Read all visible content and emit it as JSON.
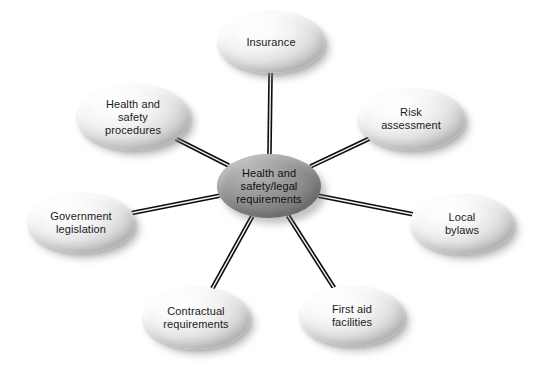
{
  "diagram": {
    "type": "radial-spoke-diagram",
    "title": "Health and safety/legal requirements",
    "background_color": "#ffffff",
    "center_node": {
      "id": "center",
      "label": "Health and\nsafety/legal\nrequirements",
      "fill_color": "#9b9b9b",
      "text_color": "#0f0f0f",
      "cx": 269,
      "cy": 186,
      "rx": 52,
      "ry": 32
    },
    "edge_style": {
      "kind": "double-line-rod",
      "stroke_color": "#0d0d0d",
      "gap_color": "#f4f4f4",
      "stroke_width": 1.6,
      "gap_width": 1.4
    },
    "nodes": [
      {
        "id": "insurance",
        "label": "Insurance",
        "position": "top",
        "fill_color": "#eeeeee",
        "text_color": "#1a1a1a",
        "cx": 271,
        "cy": 42,
        "rx": 54,
        "ry": 31
      },
      {
        "id": "risk-assessment",
        "label": "Risk\nassessment",
        "position": "upper-right",
        "fill_color": "#eeeeee",
        "text_color": "#1a1a1a",
        "cx": 411,
        "cy": 119,
        "rx": 54,
        "ry": 31
      },
      {
        "id": "local-bylaws",
        "label": "Local\nbylaws",
        "position": "right",
        "fill_color": "#eeeeee",
        "text_color": "#1a1a1a",
        "cx": 462,
        "cy": 224,
        "rx": 52,
        "ry": 30
      },
      {
        "id": "first-aid-facilities",
        "label": "First aid\nfacilities",
        "position": "lower-right",
        "fill_color": "#eeeeee",
        "text_color": "#1a1a1a",
        "cx": 352,
        "cy": 316,
        "rx": 53,
        "ry": 30
      },
      {
        "id": "contractual-requirements",
        "label": "Contractual\nrequirements",
        "position": "lower-left",
        "fill_color": "#eeeeee",
        "text_color": "#1a1a1a",
        "cx": 196,
        "cy": 318,
        "rx": 54,
        "ry": 31
      },
      {
        "id": "government-legislation",
        "label": "Government\nlegislation",
        "position": "left",
        "fill_color": "#eeeeee",
        "text_color": "#1a1a1a",
        "cx": 81,
        "cy": 223,
        "rx": 54,
        "ry": 30
      },
      {
        "id": "health-and-safety-procedures",
        "label": "Health and\nsafety\nprocedures",
        "position": "upper-left",
        "fill_color": "#eeeeee",
        "text_color": "#1a1a1a",
        "cx": 133,
        "cy": 117,
        "rx": 57,
        "ry": 33
      }
    ],
    "edges": [
      {
        "id": "edge-center-insurance",
        "from": "center",
        "to": "insurance"
      },
      {
        "id": "edge-center-risk-assessment",
        "from": "center",
        "to": "risk-assessment"
      },
      {
        "id": "edge-center-local-bylaws",
        "from": "center",
        "to": "local-bylaws"
      },
      {
        "id": "edge-center-first-aid-facilities",
        "from": "center",
        "to": "first-aid-facilities"
      },
      {
        "id": "edge-center-contractual-requirements",
        "from": "center",
        "to": "contractual-requirements"
      },
      {
        "id": "edge-center-government-legislation",
        "from": "center",
        "to": "government-legislation"
      },
      {
        "id": "edge-center-health-and-safety-procedures",
        "from": "center",
        "to": "health-and-safety-procedures"
      }
    ]
  }
}
